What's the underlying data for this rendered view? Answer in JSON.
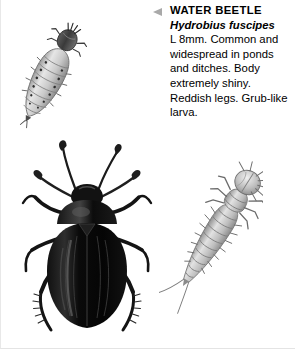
{
  "entry": {
    "marker_icon": "left-triangle-marker",
    "common_name": "WATER BEETLE",
    "scientific_name": "Hydrobius fuscipes",
    "description": "L 8mm. Common and widespread in ponds and ditches. Body extremely shiny. Reddish legs. Grub-like larva."
  },
  "figures": [
    {
      "id": "larva-grub",
      "name": "grub-like-larva-illustration",
      "caption": ""
    },
    {
      "id": "adult-beetle",
      "name": "adult-water-beetle-illustration",
      "caption": ""
    },
    {
      "id": "larva-elongate",
      "name": "elongate-larva-illustration",
      "caption": ""
    }
  ],
  "colors": {
    "text": "#000000",
    "marker": "#a9a9a9",
    "beetle_body": "#0b0b0b",
    "larva_shade": "#8d8d8d",
    "background": "#ffffff"
  }
}
